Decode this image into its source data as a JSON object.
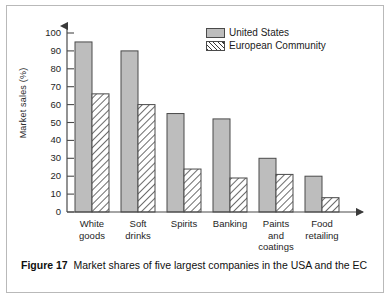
{
  "figure": {
    "caption_label": "Figure 17",
    "caption_text": "Market shares of five largest companies in the USA and the EC"
  },
  "legend": {
    "position": "top-right",
    "entries": [
      {
        "label": "United States",
        "swatch": "solid-gray-swatch",
        "color": "#bdbdbd"
      },
      {
        "label": "European Community",
        "swatch": "hatched-swatch",
        "color": "#3a3a3a"
      }
    ]
  },
  "axes": {
    "ylabel": "Market sales (%)",
    "xlabel": "",
    "yticks": [
      0,
      10,
      20,
      30,
      40,
      50,
      60,
      70,
      80,
      90,
      100
    ],
    "ytick_labels": [
      "0",
      "10",
      "20",
      "30",
      "40",
      "50",
      "60",
      "70",
      "80",
      "90",
      "100"
    ],
    "ylim": [
      0,
      100
    ],
    "grid": false,
    "y_arrow": true,
    "x_arrow": true
  },
  "chart_data": {
    "type": "bar",
    "title": "",
    "xlabel": "",
    "ylabel": "Market sales (%)",
    "ylim": [
      0,
      100
    ],
    "grid": false,
    "legend_position": "top-right",
    "categories": [
      "White\ngoods",
      "Soft\ndrinks",
      "Spirits",
      "Banking",
      "Paints\nand\ncoatings",
      "Food\nretailing"
    ],
    "category_labels_flat": [
      "White goods",
      "Soft drinks",
      "Spirits",
      "Banking",
      "Paints and coatings",
      "Food retailing"
    ],
    "series": [
      {
        "name": "United States",
        "values": [
          95,
          90,
          55,
          52,
          30,
          20
        ],
        "color": "#bdbdbd",
        "fill": "solid"
      },
      {
        "name": "European Community",
        "values": [
          66,
          60,
          24,
          19,
          21,
          8
        ],
        "color": "#ffffff",
        "fill": "hatched"
      }
    ]
  }
}
